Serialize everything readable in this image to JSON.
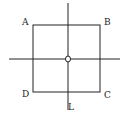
{
  "diagram": {
    "square": {
      "x": 33,
      "y": 25,
      "width": 67,
      "height": 67
    },
    "axes": {
      "vertical": {
        "x": 68,
        "y1": 3,
        "y2": 110
      },
      "horizontal": {
        "y": 59,
        "x1": 9,
        "x2": 120
      }
    },
    "center_point": {
      "cx": 68,
      "cy": 59,
      "r": 2.5,
      "label": "O"
    },
    "labels": {
      "A": "A",
      "B": "B",
      "C": "C",
      "D": "D",
      "L": "L"
    },
    "colors": {
      "stroke": "#222222",
      "background": "#ffffff"
    }
  }
}
